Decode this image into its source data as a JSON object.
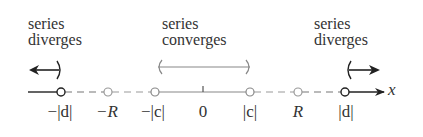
{
  "regions": {
    "left": {
      "line1": "series",
      "line2": "diverges"
    },
    "center": {
      "line1": "series",
      "line2": "converges"
    },
    "right": {
      "line1": "series",
      "line2": "diverges"
    }
  },
  "axis": {
    "variable": "x",
    "ticks": [
      {
        "id": "neg-d",
        "label": "−|d|",
        "marker": "open-circle-dark"
      },
      {
        "id": "neg-R",
        "label": "−R",
        "marker": "open-circle-light"
      },
      {
        "id": "neg-c",
        "label": "−|c|",
        "marker": "open-circle-light"
      },
      {
        "id": "zero",
        "label": "0",
        "marker": "tick"
      },
      {
        "id": "pos-c",
        "label": "|c|",
        "marker": "open-circle-light"
      },
      {
        "id": "pos-R",
        "label": "R",
        "marker": "open-circle-light"
      },
      {
        "id": "pos-d",
        "label": "|d|",
        "marker": "open-circle-dark"
      }
    ]
  },
  "colors": {
    "dark": "#222222",
    "light": "#8a8a8a"
  }
}
